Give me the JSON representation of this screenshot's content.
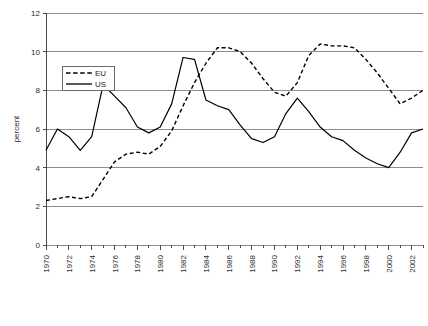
{
  "chart_data": {
    "type": "line",
    "title": "",
    "xlabel": "",
    "ylabel": "percent",
    "xlim": [
      1970,
      2003
    ],
    "ylim": [
      0,
      12
    ],
    "ytick_step": 2,
    "yticks": [
      0,
      2,
      4,
      6,
      8,
      10,
      12
    ],
    "ytick_labels": [
      "0",
      "2",
      "4",
      "6",
      "8",
      "10",
      "12"
    ],
    "x": [
      1970,
      1971,
      1972,
      1973,
      1974,
      1975,
      1976,
      1977,
      1978,
      1979,
      1980,
      1981,
      1982,
      1983,
      1984,
      1985,
      1986,
      1987,
      1988,
      1989,
      1990,
      1991,
      1992,
      1993,
      1994,
      1995,
      1996,
      1997,
      1998,
      1999,
      2000,
      2001,
      2002,
      2003
    ],
    "xtick_labels": [
      "1970",
      "1972",
      "1974",
      "1976",
      "1978",
      "1980",
      "1982",
      "1984",
      "1986",
      "1988",
      "1990",
      "1992",
      "1994",
      "1996",
      "1998",
      "2000",
      "2002"
    ],
    "xtick_values": [
      1970,
      1972,
      1974,
      1976,
      1978,
      1980,
      1982,
      1984,
      1986,
      1988,
      1990,
      1992,
      1994,
      1996,
      1998,
      2000,
      2002
    ],
    "minor_ticks_every": 1,
    "grid": "horizontal",
    "legend_position": "upper-left-inside",
    "series": [
      {
        "name": "EU",
        "style": "dashed",
        "color": "#000000",
        "values": [
          2.3,
          2.4,
          2.5,
          2.4,
          2.5,
          3.4,
          4.3,
          4.7,
          4.8,
          4.7,
          5.1,
          5.9,
          7.2,
          8.4,
          9.4,
          10.2,
          10.2,
          10.0,
          9.4,
          8.6,
          7.9,
          7.7,
          8.4,
          9.8,
          10.4,
          10.3,
          10.3,
          10.2,
          9.6,
          8.9,
          8.1,
          7.3,
          7.6,
          8.0
        ]
      },
      {
        "name": "US",
        "style": "solid",
        "color": "#000000",
        "values": [
          4.9,
          6.0,
          5.6,
          4.9,
          5.6,
          8.3,
          7.7,
          7.1,
          6.1,
          5.8,
          6.1,
          7.3,
          9.7,
          9.6,
          7.5,
          7.2,
          7.0,
          6.2,
          5.5,
          5.3,
          5.6,
          6.8,
          7.6,
          6.9,
          6.1,
          5.6,
          5.4,
          4.9,
          4.5,
          4.2,
          4.0,
          4.8,
          5.8,
          6.0
        ]
      }
    ]
  },
  "legend": {
    "entries": [
      {
        "label": "EU"
      },
      {
        "label": "US"
      }
    ]
  },
  "axis": {
    "y_title": "percent"
  }
}
